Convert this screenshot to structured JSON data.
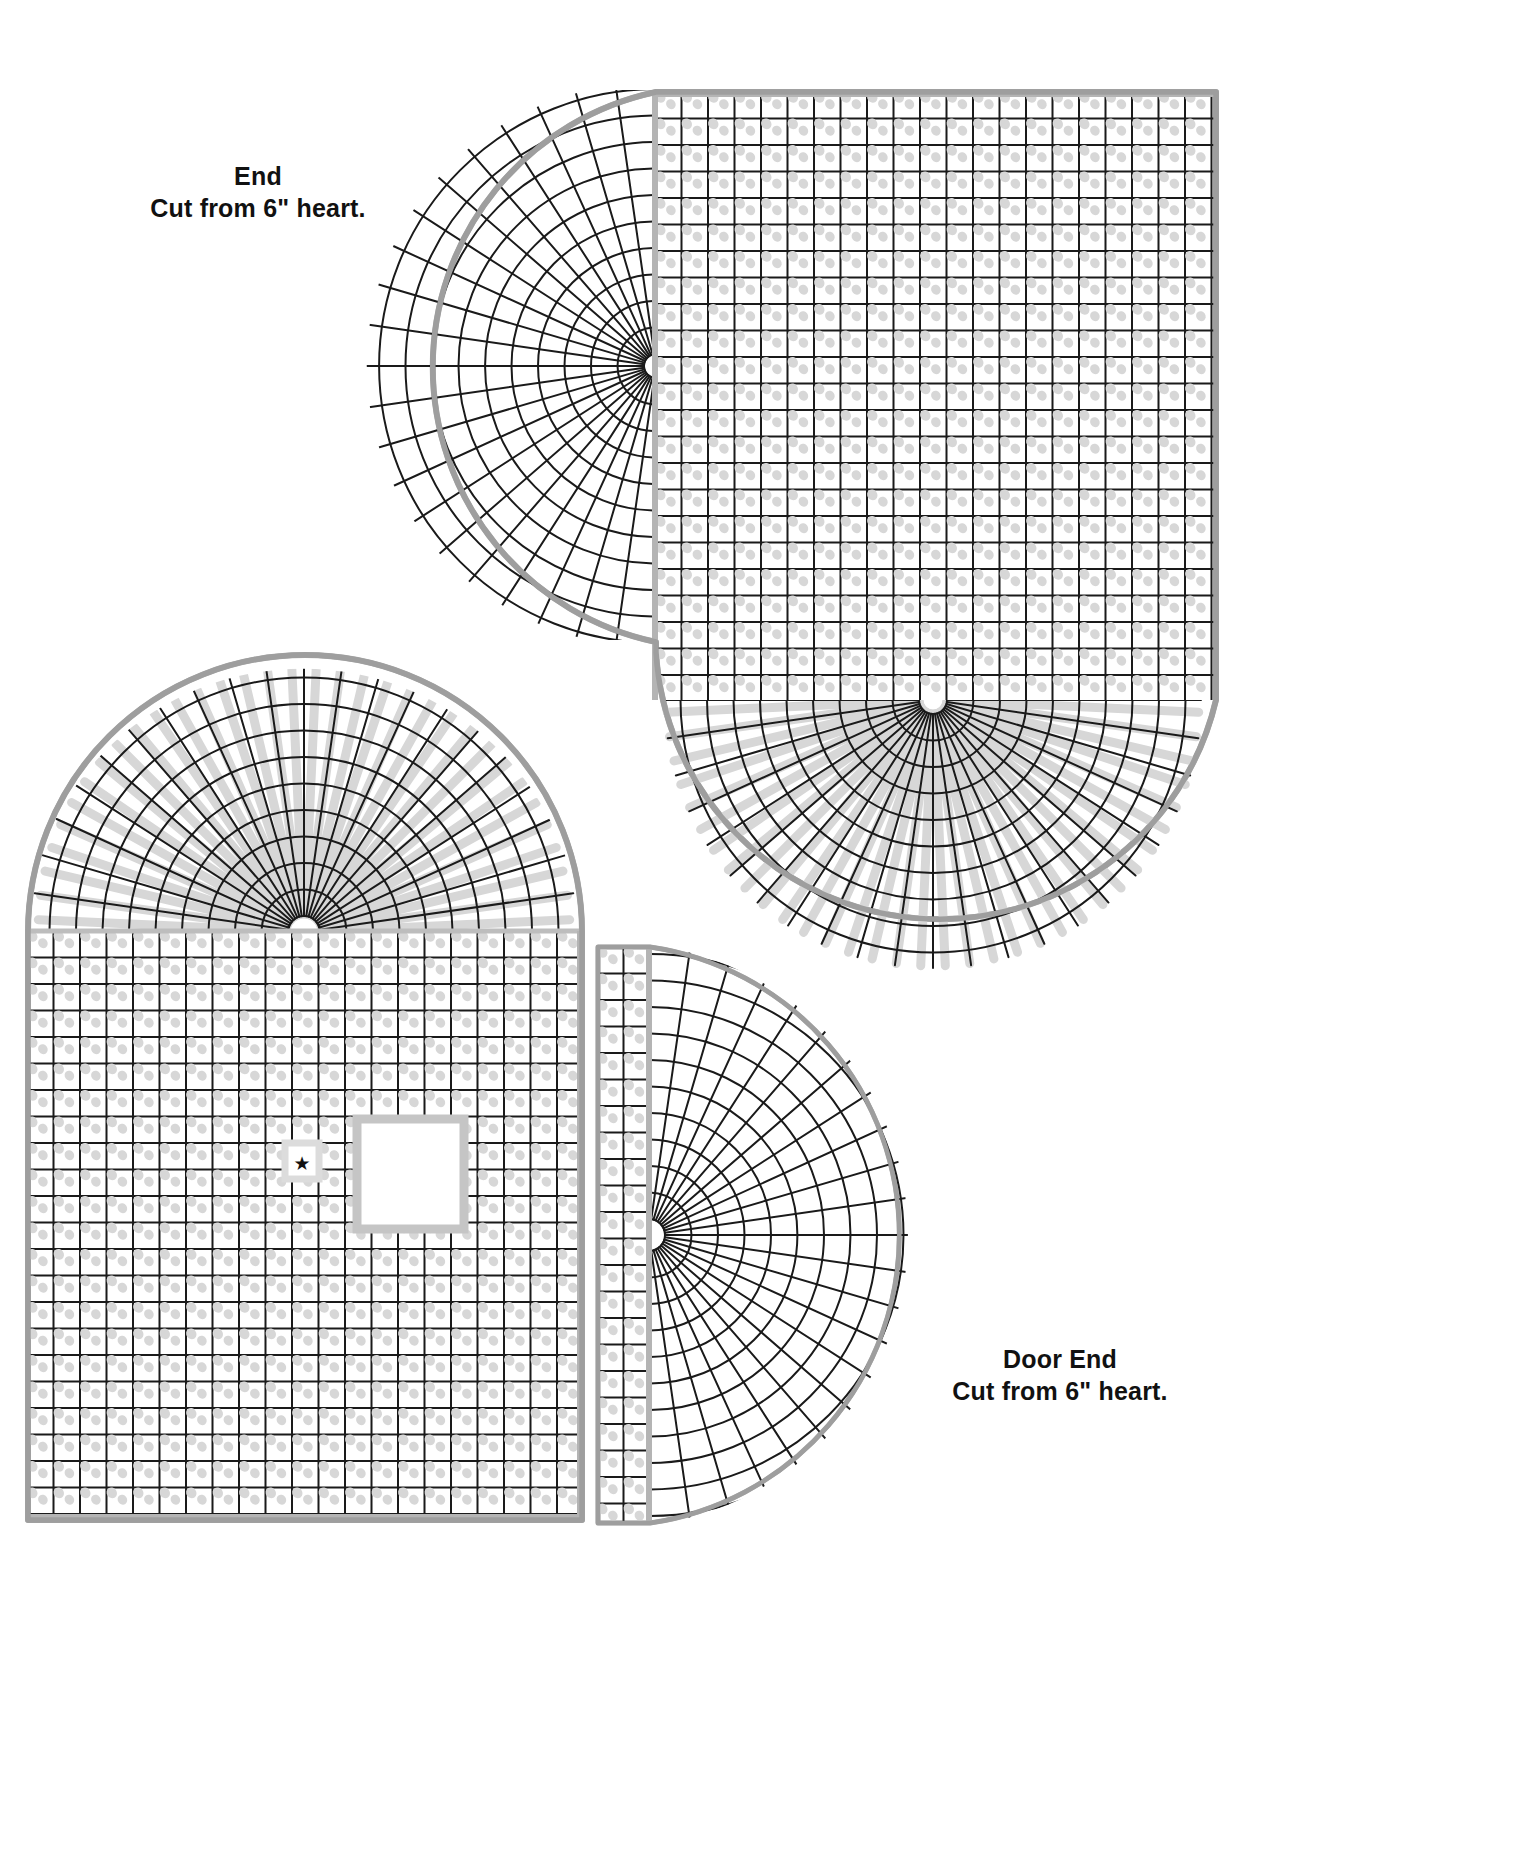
{
  "document": {
    "kind": "plastic-canvas-cutting-pattern",
    "background_color": "#ffffff"
  },
  "colors": {
    "grid_line": "#1a1a1a",
    "outline": "#9a9a9a",
    "stitch_mark": "#d7d7d7",
    "label_text": "#111111",
    "page_background": "#ffffff"
  },
  "labels": [
    {
      "id": "label-end",
      "line1": "End",
      "line2": "Cut from 6\" heart."
    },
    {
      "id": "label-door-end",
      "line1": "Door End",
      "line2": "Cut from 6\" heart."
    }
  ],
  "pieces": [
    {
      "id": "piece-end",
      "name": "End",
      "instruction": "Cut from 6\" heart.",
      "position": "top-right",
      "outline_note": "rounded top-left arch and rounded bottom-left fan, straight right edge",
      "grid_cells_wide": 30,
      "grid_cells_tall": 36,
      "cell_size_px": 26.5,
      "has_square_hole": false,
      "has_star_marker": false
    },
    {
      "id": "piece-door-end",
      "name": "Door End",
      "instruction": "Cut from 6\" heart.",
      "position": "bottom-left",
      "outline_note": "arched top, straight sides and bottom, square door opening with star marker",
      "grid_cells_wide": 22,
      "grid_cells_tall": 32,
      "cell_size_px": 26.5,
      "has_square_hole": true,
      "has_star_marker": true,
      "star_glyph": "★",
      "square_hole": {
        "x": 355,
        "y": 1117,
        "width": 110,
        "height": 113
      }
    },
    {
      "id": "piece-door-end-fan",
      "name": "Door End fan section",
      "instruction": "Cut from 6\" heart.",
      "position": "bottom-right",
      "outline_note": "half-round fan radiating from left-centre point",
      "grid_cells_wide": 18,
      "grid_cells_tall": 22,
      "cell_size_px": 26.5,
      "has_square_hole": false,
      "has_star_marker": false
    }
  ],
  "star_marker": {
    "glyph": "★",
    "x": 302,
    "y": 1163
  }
}
